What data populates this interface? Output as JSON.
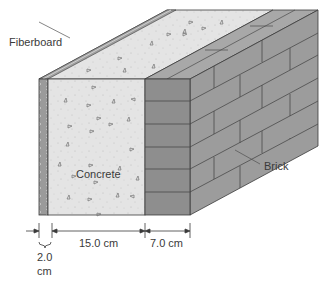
{
  "diagram": {
    "labels": {
      "fiberboard": "Fiberboard",
      "concrete": "Concrete",
      "brick": "Brick"
    },
    "dimensions": {
      "fiberboard_value": "2.0",
      "fiberboard_unit": "cm",
      "concrete": "15.0 cm",
      "brick": "7.0 cm"
    },
    "colors": {
      "fiberboard": "#9a9a9a",
      "concrete": "#e4e4e4",
      "concrete_top": "#dedede",
      "brick_front": "#8e8e8e",
      "brick_side": "#9c9c9c",
      "brick_top": "#a8a8a8",
      "mortar": "#4a4a4a",
      "outline": "#3a3a3a"
    }
  }
}
